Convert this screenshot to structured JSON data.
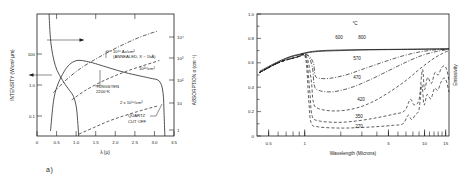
{
  "figure": {
    "caption_a": "a)",
    "caption_b": "b)"
  },
  "chart_data": [
    {
      "type": "line",
      "panel": "a",
      "title": "",
      "xlabel": "λ (μ)",
      "ylabel": "INTENSITY (W/cm² μm)",
      "y2label": "ABSORPTION α (cm⁻¹)",
      "xlim": [
        0,
        3.75
      ],
      "xticks": [
        "0",
        "0.5",
        "1.0",
        "1.5",
        "2.0",
        "2.5",
        "3.0",
        "3.5"
      ],
      "xtickvals": [
        0,
        0.5,
        1.0,
        1.5,
        2.0,
        2.5,
        3.0,
        3.5
      ],
      "ylim_log": [
        0.02,
        300
      ],
      "yticks": [
        "100",
        "1.0",
        "0.1"
      ],
      "ytickvals": [
        100,
        1.0,
        0.1
      ],
      "y2ticks": [
        "10⁴",
        "10³",
        "10²",
        "10",
        "1"
      ],
      "y2tickvals": [
        10000,
        1000,
        100,
        10,
        1
      ],
      "grid": false,
      "legend": "none",
      "annotations": [
        {
          "text": "10¹⁶ As/cm²",
          "role": "curve-label-implant-dose"
        },
        {
          "text": "(ANNEALED, X ~ 1kÅ)",
          "role": "curve-label-implant-anneal"
        },
        {
          "text": "10²⁰/cm³",
          "role": "curve-label-doping-1e20"
        },
        {
          "text": "TUNGSTEN",
          "role": "curve-label-tungsten"
        },
        {
          "text": "2200°K",
          "role": "curve-label-tungsten-temp"
        },
        {
          "text": "2 x 10¹⁸/cm³",
          "role": "curve-label-doping-2e18"
        },
        {
          "text": "QUARTZ",
          "role": "curve-label-quartz"
        },
        {
          "text": "CUT OFF",
          "role": "curve-label-quartz-cutoff"
        }
      ],
      "series": [
        {
          "name": "tungsten-2200K-intensity",
          "style": "solid",
          "axis": "left",
          "points": [
            [
              0.37,
              0.03
            ],
            [
              0.45,
              0.3
            ],
            [
              0.55,
              1.0
            ],
            [
              0.7,
              2.6
            ],
            [
              0.85,
              5.0
            ],
            [
              1.0,
              7.0
            ],
            [
              1.15,
              7.8
            ],
            [
              1.35,
              7.2
            ],
            [
              1.6,
              6.0
            ],
            [
              2.0,
              4.2
            ],
            [
              2.4,
              3.0
            ],
            [
              2.8,
              2.3
            ],
            [
              3.1,
              1.9
            ],
            [
              3.35,
              1.5
            ],
            [
              3.45,
              0.6
            ],
            [
              3.48,
              0.1
            ],
            [
              3.5,
              0.02
            ]
          ]
        },
        {
          "name": "quartz-transmission-cutoff",
          "style": "solid",
          "axis": "left",
          "points": [
            [
              0.33,
              300
            ],
            [
              0.36,
              60
            ],
            [
              0.4,
              20
            ],
            [
              0.46,
              8.0
            ],
            [
              0.55,
              3.5
            ],
            [
              0.7,
              1.6
            ],
            [
              0.85,
              0.85
            ],
            [
              1.0,
              0.45
            ],
            [
              1.08,
              0.18
            ],
            [
              1.12,
              0.05
            ],
            [
              1.14,
              0.02
            ]
          ]
        },
        {
          "name": "absorption-1e16-As-annealed",
          "style": "dashdot",
          "axis": "right",
          "points": [
            [
              0.45,
              60
            ],
            [
              0.8,
              200
            ],
            [
              1.2,
              600
            ],
            [
              1.6,
              1400
            ],
            [
              2.0,
              3000
            ],
            [
              2.4,
              6000
            ],
            [
              2.8,
              11000
            ],
            [
              3.1,
              16000
            ],
            [
              3.3,
              20000
            ]
          ]
        },
        {
          "name": "absorption-1e20-per-cm3",
          "style": "dashed",
          "axis": "right",
          "points": [
            [
              0.95,
              30
            ],
            [
              1.3,
              70
            ],
            [
              1.7,
              150
            ],
            [
              2.1,
              280
            ],
            [
              2.5,
              480
            ],
            [
              2.9,
              760
            ],
            [
              3.2,
              1050
            ],
            [
              3.35,
              1250
            ]
          ]
        },
        {
          "name": "absorption-2e18-per-cm3",
          "style": "dashed",
          "axis": "right",
          "points": [
            [
              1.15,
              1.2
            ],
            [
              1.55,
              2.2
            ],
            [
              1.95,
              4.0
            ],
            [
              2.35,
              6.5
            ],
            [
              2.75,
              10.0
            ],
            [
              3.05,
              13.5
            ],
            [
              3.3,
              17.0
            ]
          ]
        }
      ]
    },
    {
      "type": "line",
      "panel": "b",
      "title": "",
      "unit_label": "°C",
      "xlabel": "Wavelength (Microns)",
      "ylabel": "Emissivity",
      "xscale": "log",
      "xlim": [
        0.4,
        16
      ],
      "xticks": [
        "0.5",
        "1",
        "5",
        "10",
        "15"
      ],
      "xtickvals": [
        0.5,
        1,
        5,
        10,
        15
      ],
      "ylim": [
        0,
        1.0
      ],
      "yticks": [
        "0",
        "0.2",
        "0.4",
        "0.6",
        "0.8",
        "1.0"
      ],
      "ytickvals": [
        0,
        0.2,
        0.4,
        0.6,
        0.8,
        1.0
      ],
      "grid": false,
      "legend": "inline-curve-labels",
      "curve_labels": [
        "600",
        "800",
        "570",
        "470",
        "420",
        "350",
        "270"
      ],
      "series": [
        {
          "name": "emissivity-600C",
          "label": "600",
          "style": "solid",
          "points": [
            [
              0.42,
              0.52
            ],
            [
              0.5,
              0.56
            ],
            [
              0.6,
              0.6
            ],
            [
              0.75,
              0.645
            ],
            [
              0.9,
              0.665
            ],
            [
              1.1,
              0.685
            ],
            [
              1.4,
              0.695
            ],
            [
              2.0,
              0.7
            ],
            [
              3.0,
              0.705
            ],
            [
              5.0,
              0.708
            ],
            [
              8.0,
              0.71
            ],
            [
              11.0,
              0.712
            ],
            [
              14.0,
              0.713
            ],
            [
              16.0,
              0.714
            ]
          ]
        },
        {
          "name": "emissivity-800C",
          "label": "800",
          "style": "solid",
          "points": [
            [
              0.42,
              0.53
            ],
            [
              0.5,
              0.57
            ],
            [
              0.6,
              0.61
            ],
            [
              0.75,
              0.65
            ],
            [
              0.9,
              0.67
            ],
            [
              1.1,
              0.69
            ],
            [
              1.4,
              0.7
            ],
            [
              2.0,
              0.705
            ],
            [
              3.0,
              0.708
            ],
            [
              5.0,
              0.71
            ],
            [
              8.0,
              0.712
            ],
            [
              11.0,
              0.713
            ],
            [
              14.0,
              0.714
            ],
            [
              16.0,
              0.715
            ]
          ]
        },
        {
          "name": "emissivity-570C",
          "label": "570",
          "style": "dashdot",
          "points": [
            [
              0.42,
              0.52
            ],
            [
              0.6,
              0.6
            ],
            [
              0.85,
              0.645
            ],
            [
              1.05,
              0.665
            ],
            [
              1.18,
              0.6
            ],
            [
              1.22,
              0.5
            ],
            [
              1.3,
              0.475
            ],
            [
              1.6,
              0.472
            ],
            [
              2.2,
              0.5
            ],
            [
              3.0,
              0.545
            ],
            [
              4.5,
              0.605
            ],
            [
              6.5,
              0.655
            ],
            [
              9.0,
              0.688
            ],
            [
              12.0,
              0.705
            ],
            [
              16.0,
              0.712
            ]
          ]
        },
        {
          "name": "emissivity-470C",
          "label": "470",
          "style": "dashdot",
          "points": [
            [
              0.42,
              0.52
            ],
            [
              0.6,
              0.6
            ],
            [
              0.85,
              0.645
            ],
            [
              1.05,
              0.662
            ],
            [
              1.16,
              0.56
            ],
            [
              1.2,
              0.42
            ],
            [
              1.3,
              0.375
            ],
            [
              1.7,
              0.362
            ],
            [
              2.4,
              0.395
            ],
            [
              3.4,
              0.455
            ],
            [
              5.0,
              0.535
            ],
            [
              7.0,
              0.605
            ],
            [
              9.5,
              0.66
            ],
            [
              12.5,
              0.692
            ],
            [
              16.0,
              0.71
            ]
          ]
        },
        {
          "name": "emissivity-420C",
          "label": "420",
          "style": "dashed",
          "points": [
            [
              0.42,
              0.52
            ],
            [
              0.6,
              0.6
            ],
            [
              0.85,
              0.645
            ],
            [
              1.03,
              0.655
            ],
            [
              1.13,
              0.47
            ],
            [
              1.18,
              0.28
            ],
            [
              1.3,
              0.225
            ],
            [
              1.8,
              0.205
            ],
            [
              2.6,
              0.225
            ],
            [
              3.6,
              0.275
            ],
            [
              5.0,
              0.355
            ],
            [
              7.0,
              0.455
            ],
            [
              9.0,
              0.545
            ],
            [
              11.5,
              0.625
            ],
            [
              14.0,
              0.675
            ],
            [
              16.0,
              0.7
            ]
          ]
        },
        {
          "name": "emissivity-350C",
          "label": "350",
          "style": "dashed",
          "points": [
            [
              0.42,
              0.52
            ],
            [
              0.6,
              0.6
            ],
            [
              0.85,
              0.645
            ],
            [
              1.02,
              0.65
            ],
            [
              1.1,
              0.38
            ],
            [
              1.15,
              0.17
            ],
            [
              1.3,
              0.125
            ],
            [
              1.9,
              0.112
            ],
            [
              2.8,
              0.125
            ],
            [
              4.0,
              0.15
            ],
            [
              5.5,
              0.178
            ],
            [
              6.8,
              0.205
            ],
            [
              7.6,
              0.3
            ],
            [
              8.2,
              0.255
            ],
            [
              9.0,
              0.3
            ],
            [
              9.6,
              0.545
            ],
            [
              10.0,
              0.38
            ],
            [
              10.6,
              0.48
            ],
            [
              11.4,
              0.43
            ],
            [
              12.2,
              0.52
            ],
            [
              13.0,
              0.5
            ],
            [
              13.8,
              0.555
            ],
            [
              14.6,
              0.575
            ],
            [
              15.3,
              0.545
            ],
            [
              16.0,
              0.455
            ]
          ]
        },
        {
          "name": "emissivity-270C",
          "label": "270",
          "style": "dashed",
          "points": [
            [
              0.42,
              0.52
            ],
            [
              0.6,
              0.6
            ],
            [
              0.85,
              0.645
            ],
            [
              1.01,
              0.648
            ],
            [
              1.08,
              0.3
            ],
            [
              1.13,
              0.11
            ],
            [
              1.3,
              0.075
            ],
            [
              2.0,
              0.065
            ],
            [
              3.0,
              0.07
            ],
            [
              4.2,
              0.078
            ],
            [
              5.5,
              0.088
            ],
            [
              6.6,
              0.1
            ],
            [
              7.3,
              0.17
            ],
            [
              7.8,
              0.135
            ],
            [
              8.4,
              0.175
            ],
            [
              9.0,
              0.22
            ],
            [
              9.5,
              0.42
            ],
            [
              9.9,
              0.255
            ],
            [
              10.5,
              0.34
            ],
            [
              11.3,
              0.305
            ],
            [
              12.1,
              0.39
            ],
            [
              12.9,
              0.375
            ],
            [
              13.7,
              0.44
            ],
            [
              14.5,
              0.475
            ],
            [
              15.2,
              0.45
            ],
            [
              16.0,
              0.36
            ]
          ]
        }
      ]
    }
  ]
}
